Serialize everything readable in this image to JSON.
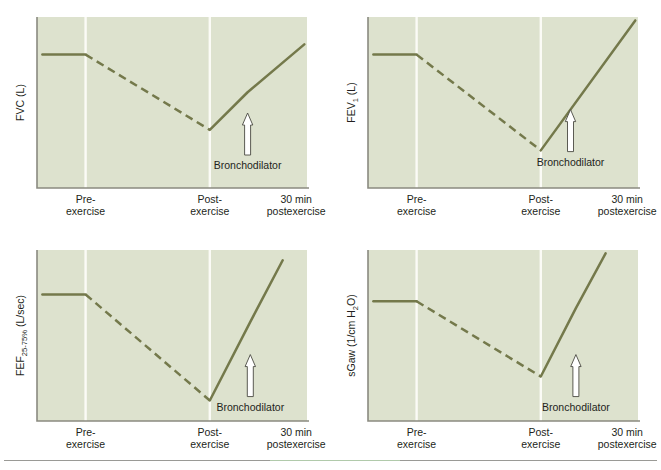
{
  "figure": {
    "background_color": "#ffffff",
    "plot_background_color": "#dde2ce",
    "trace_color": "#74794b",
    "gridline_color": "#fbfbf6",
    "axis_color": "#8a8a80",
    "arrow_fill": "#ffffff",
    "arrow_stroke": "#4a4a42"
  },
  "shared": {
    "annotation_label": "Bronchodilator",
    "tick_labels": [
      {
        "line1": "Pre-",
        "line2": "exercise"
      },
      {
        "line1": "Post-",
        "line2": "exercise"
      },
      {
        "line1": "30 min",
        "line2": "postexercise"
      }
    ]
  },
  "panels": [
    {
      "id": "fvc",
      "ylabel_main": "FVC",
      "ylabel_sub": "",
      "ylabel_sub2": "",
      "ylabel_units": " (L)",
      "annotation": "Bronchodilator"
    },
    {
      "id": "fev1",
      "ylabel_main": "FEV",
      "ylabel_sub": "1",
      "ylabel_sub2": "",
      "ylabel_units": " (L)",
      "annotation": "Bronchodilator"
    },
    {
      "id": "fef2575",
      "ylabel_main": "FEF",
      "ylabel_sub": "25-75%",
      "ylabel_sub2": "",
      "ylabel_units": " (L/sec)",
      "annotation": "Bronchodilator"
    },
    {
      "id": "sgaw",
      "ylabel_main": "sGaw (1/cm H",
      "ylabel_sub": "2",
      "ylabel_sub2": "O)",
      "ylabel_units": "",
      "annotation": "Bronchodilator"
    }
  ],
  "chart_data": [
    {
      "type": "line",
      "title": "FVC (L)",
      "ylabel": "FVC (L)",
      "xlabel": "",
      "xlim": [
        0,
        100
      ],
      "ylim": [
        0,
        100
      ],
      "grid": true,
      "gridlines_x": [
        18,
        64
      ],
      "legend": "none",
      "xtick_positions": [
        18,
        64,
        96
      ],
      "xtick_labels": [
        "Pre-exercise",
        "Post-exercise",
        "30 min postexercise"
      ],
      "annotations": [
        {
          "text": "Bronchodilator",
          "x": 78,
          "y": 38,
          "marker": "up-arrow",
          "arrow_x": 78
        }
      ],
      "series": [
        {
          "name": "baseline",
          "style": "solid",
          "x": [
            2,
            18
          ],
          "y": [
            78,
            78
          ]
        },
        {
          "name": "exercise-induced fall",
          "style": "dashed",
          "x": [
            18,
            64
          ],
          "y": [
            78,
            34
          ]
        },
        {
          "name": "recovery",
          "style": "solid",
          "x": [
            64,
            78,
            99
          ],
          "y": [
            34,
            56,
            84
          ]
        }
      ]
    },
    {
      "type": "line",
      "title": "FEV1 (L)",
      "ylabel": "FEV1 (L)",
      "xlabel": "",
      "xlim": [
        0,
        100
      ],
      "ylim": [
        0,
        100
      ],
      "grid": true,
      "gridlines_x": [
        18,
        64
      ],
      "legend": "none",
      "xtick_positions": [
        18,
        64,
        96
      ],
      "xtick_labels": [
        "Pre-exercise",
        "Post-exercise",
        "30 min postexercise"
      ],
      "annotations": [
        {
          "text": "Bronchodilator",
          "x": 75,
          "y": 40,
          "marker": "up-arrow",
          "arrow_x": 75
        }
      ],
      "series": [
        {
          "name": "baseline",
          "style": "solid",
          "x": [
            2,
            18
          ],
          "y": [
            78,
            78
          ]
        },
        {
          "name": "exercise-induced fall",
          "style": "dashed",
          "x": [
            18,
            64
          ],
          "y": [
            78,
            22
          ]
        },
        {
          "name": "recovery",
          "style": "solid",
          "x": [
            64,
            99
          ],
          "y": [
            22,
            98
          ]
        }
      ]
    },
    {
      "type": "line",
      "title": "FEF25-75% (L/sec)",
      "ylabel": "FEF25-75% (L/sec)",
      "xlabel": "",
      "xlim": [
        0,
        100
      ],
      "ylim": [
        0,
        100
      ],
      "grid": true,
      "gridlines_x": [
        18,
        64
      ],
      "legend": "none",
      "xtick_positions": [
        18,
        64,
        96
      ],
      "xtick_labels": [
        "Pre-exercise",
        "Post-exercise",
        "30 min postexercise"
      ],
      "annotations": [
        {
          "text": "Bronchodilator",
          "x": 79,
          "y": 33,
          "marker": "up-arrow",
          "arrow_x": 79
        }
      ],
      "series": [
        {
          "name": "baseline",
          "style": "solid",
          "x": [
            2,
            18
          ],
          "y": [
            74,
            74
          ]
        },
        {
          "name": "exercise-induced fall",
          "style": "dashed",
          "x": [
            18,
            64
          ],
          "y": [
            74,
            12
          ]
        },
        {
          "name": "recovery",
          "style": "solid",
          "x": [
            64,
            79,
            91
          ],
          "y": [
            12,
            58,
            94
          ]
        }
      ]
    },
    {
      "type": "line",
      "title": "sGaw (1/cm H2O)",
      "ylabel": "sGaw (1/cm H2O)",
      "xlabel": "",
      "xlim": [
        0,
        100
      ],
      "ylim": [
        0,
        100
      ],
      "grid": true,
      "gridlines_x": [
        18,
        64
      ],
      "legend": "none",
      "xtick_positions": [
        18,
        64,
        96
      ],
      "xtick_labels": [
        "Pre-exercise",
        "Post-exercise",
        "30 min postexercise"
      ],
      "annotations": [
        {
          "text": "Bronchodilator",
          "x": 77,
          "y": 33,
          "marker": "up-arrow",
          "arrow_x": 77
        }
      ],
      "series": [
        {
          "name": "baseline",
          "style": "solid",
          "x": [
            2,
            18
          ],
          "y": [
            70,
            70
          ]
        },
        {
          "name": "exercise-induced fall",
          "style": "dashed",
          "x": [
            18,
            64
          ],
          "y": [
            70,
            26
          ]
        },
        {
          "name": "recovery",
          "style": "solid",
          "x": [
            64,
            77,
            88
          ],
          "y": [
            26,
            66,
            98
          ]
        }
      ]
    }
  ]
}
